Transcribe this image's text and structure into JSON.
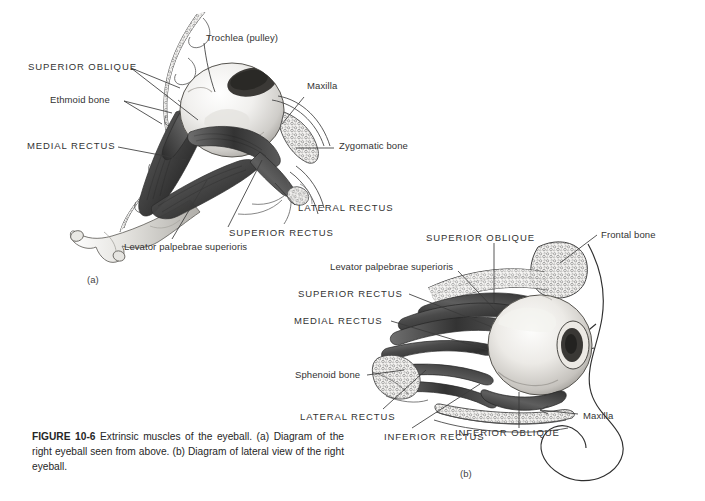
{
  "figure": {
    "number": "FIGURE 10-6",
    "caption_text": " Extrinsic muscles of the eyeball. (a) Diagram of the right eyeball seen from above. (b) Diagram of lateral view of the right eyeball.",
    "caption_full": "FIGURE 10-6 Extrinsic muscles of the eyeball. (a) Diagram of the right eyeball seen from above. (b) Diagram of lateral view of the right eyeball."
  },
  "panel_a": {
    "id": "(a)",
    "description": "Diagram of the right eyeball seen from above",
    "labels": [
      {
        "key": "trochlea",
        "text": "Trochlea  (pulley)"
      },
      {
        "key": "superior_oblique",
        "text": "SUPERIOR  OBLIQUE"
      },
      {
        "key": "ethmoid_bone",
        "text": "Ethmoid bone"
      },
      {
        "key": "medial_rectus",
        "text": "MEDIAL  RECTUS"
      },
      {
        "key": "maxilla",
        "text": "Maxilla"
      },
      {
        "key": "zygomatic_bone",
        "text": "Zygomatic bone"
      },
      {
        "key": "lateral_rectus",
        "text": "LATERAL  RECTUS"
      },
      {
        "key": "superior_rectus",
        "text": "SUPERIOR  RECTUS"
      },
      {
        "key": "levator_palpebrae",
        "text": "Levator palpebrae superioris"
      }
    ]
  },
  "panel_b": {
    "id": "(b)",
    "description": "Diagram of lateral view of the right eyeball",
    "labels": [
      {
        "key": "superior_oblique",
        "text": "SUPERIOR  OBLIQUE"
      },
      {
        "key": "frontal_bone",
        "text": "Frontal bone"
      },
      {
        "key": "levator_palpebrae",
        "text": "Levator palpebrae superioris"
      },
      {
        "key": "superior_rectus",
        "text": "SUPERIOR RECTUS"
      },
      {
        "key": "medial_rectus",
        "text": "MEDIAL  RECTUS"
      },
      {
        "key": "sphenoid_bone",
        "text": "Sphenoid bone"
      },
      {
        "key": "lateral_rectus",
        "text": "LATERAL  RECTUS"
      },
      {
        "key": "inferior_rectus",
        "text": "INFERIOR  RECTUS"
      },
      {
        "key": "inferior_oblique",
        "text": "INFERIOR OBLIQUE"
      },
      {
        "key": "maxilla",
        "text": "Maxilla"
      }
    ]
  },
  "colors": {
    "background": "#ffffff",
    "ink": "#262626",
    "leader_line": "#333333",
    "muscle_dark": "#3a3a3a",
    "muscle_mid": "#6e6e6e",
    "sclera_light": "#f2f2f0",
    "bone_light": "#d8d8d6"
  }
}
